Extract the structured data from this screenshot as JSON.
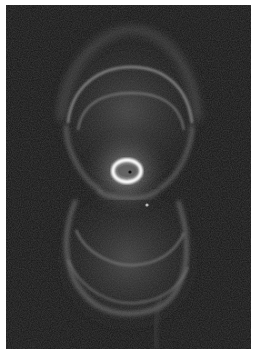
{
  "image": {
    "subject": "hourglass-shaped planetary nebula",
    "colors": {
      "background": "#141414",
      "border": "#ffffff",
      "nebula_glow": "#8a8a8a",
      "ring_highlight": "#c8c8c8",
      "core": "#ffffff"
    }
  }
}
